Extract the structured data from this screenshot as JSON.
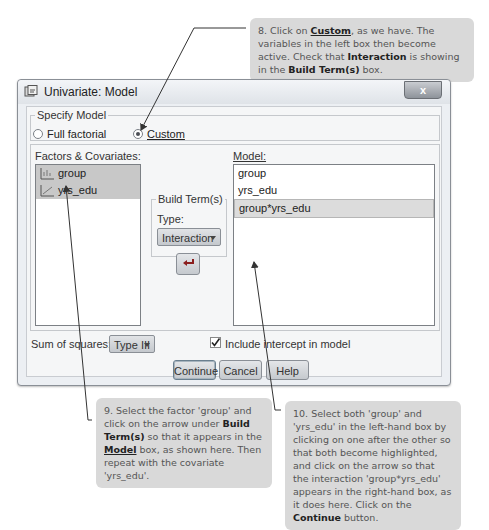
{
  "callouts": {
    "c8": {
      "prefix": "8. Click on ",
      "custom": "Custom",
      "mid": ", as we have. The variables in the left box then become active. Check that ",
      "interaction": "Interaction",
      "mid2": " is showing in the ",
      "build": "Build Term(s)",
      "suffix": " box."
    },
    "c9": {
      "prefix": "9. Select the factor 'group' and click on the arrow under ",
      "build": "Build Term(s)",
      "mid": " so that it appears in the ",
      "model": "Model",
      "suffix": " box, as shown here. Then repeat with the covariate 'yrs_edu'."
    },
    "c10": {
      "prefix": "10. Select both 'group' and 'yrs_edu' in the left-hand box by clicking on one after the other so that both become highlighted, and click on the arrow so that the interaction 'group*yrs_edu' appears in the right-hand box, as it does here. Click on the ",
      "continue": "Continue",
      "suffix": " button."
    }
  },
  "window": {
    "title": "Univariate: Model",
    "close_label": "x"
  },
  "specify_model": {
    "legend": "Specify Model",
    "options": [
      {
        "label": "Full factorial",
        "selected": false
      },
      {
        "label": "Custom",
        "selected": true
      }
    ]
  },
  "factors": {
    "label": "Factors & Covariates:",
    "items": [
      {
        "label": "group",
        "icon": "nominal-variable-icon"
      },
      {
        "label": "yrs_edu",
        "icon": "scale-variable-icon"
      }
    ]
  },
  "build_terms": {
    "legend": "Build Term(s)",
    "type_label": "Type:",
    "type_value": "Interaction",
    "arrow_icon": "move-right-arrow-icon"
  },
  "model": {
    "label": "Model:",
    "items": [
      "group",
      "yrs_edu",
      "group*yrs_edu"
    ]
  },
  "footer": {
    "sum_squares_label": "Sum of squares:",
    "sum_squares_value": "Type III",
    "intercept_label": "Include intercept in model",
    "intercept_checked": true,
    "buttons": {
      "continue": "Continue",
      "cancel": "Cancel",
      "help": "Help"
    }
  }
}
